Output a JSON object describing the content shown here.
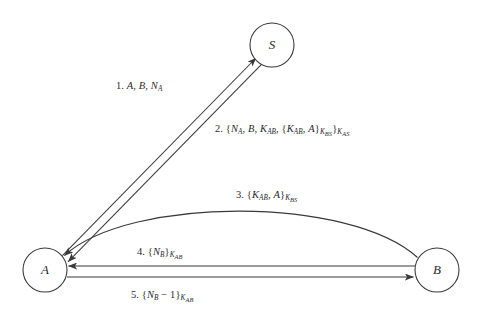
{
  "diagram": {
    "background_color": "#ffffff",
    "line_color": "#3a3a3a",
    "text_color": "#2b2b2b",
    "nodes": [
      {
        "id": "S",
        "label": "S",
        "cx": 272,
        "cy": 45,
        "r": 22
      },
      {
        "id": "A",
        "label": "A",
        "cx": 45,
        "cy": 270,
        "r": 22
      },
      {
        "id": "B",
        "label": "B",
        "cx": 437,
        "cy": 270,
        "r": 22
      }
    ],
    "messages": [
      {
        "number": "1.",
        "from": "A",
        "to": "S",
        "plain": "1. A, B, NA",
        "x": 116,
        "y": 81
      },
      {
        "number": "2.",
        "from": "S",
        "to": "A",
        "plain": "2. {NA, B, KAB, {KAB, A}KBS}KAS",
        "x": 215,
        "y": 124
      },
      {
        "number": "3.",
        "from": "B",
        "to": "A",
        "plain": "3. {KAB, A}KBS",
        "x": 236,
        "y": 190
      },
      {
        "number": "4.",
        "from": "B",
        "to": "A",
        "plain": "4. {NB}KAB",
        "x": 137,
        "y": 247
      },
      {
        "number": "5.",
        "from": "A",
        "to": "B",
        "plain": "5. {NB - 1}KAB",
        "x": 131,
        "y": 290
      }
    ],
    "symbols": {
      "A": "A",
      "B": "B",
      "S": "S",
      "NA": "N",
      "NA_sub": "A",
      "NB": "N",
      "NB_sub": "B",
      "K": "K",
      "KAB_sub": "AB",
      "KBS_sub": "BS",
      "KAS_sub": "AS",
      "minus_one": "− 1",
      "comma": ",",
      "open_brace": "{",
      "close_brace": "}"
    }
  }
}
